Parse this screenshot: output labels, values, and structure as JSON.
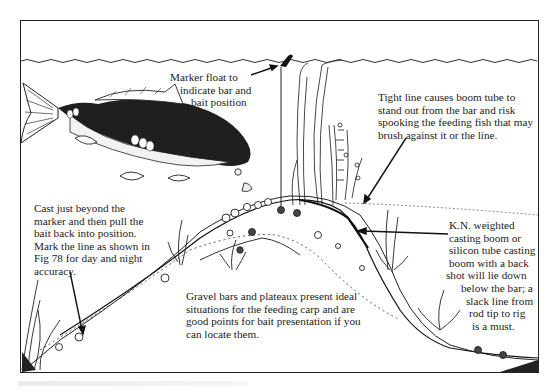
{
  "diagram": {
    "type": "illustrated-annotated-cross-section",
    "annotations": {
      "marker_float": [
        "Marker float to",
        "indicate bar and",
        "bait position"
      ],
      "tight_line": [
        "Tight line causes boom tube to",
        "stand out from the bar and risk",
        "spooking the feeding fish that may",
        "brush against it or the line."
      ],
      "cast": [
        "Cast just beyond the",
        "marker and then pull the",
        "bait back into position.",
        "Mark the line as shown in",
        "Fig 78 for day and night",
        "accuracy."
      ],
      "gravel_bars": [
        "Gravel bars and plateaux present ideal",
        "situations for the feeding carp and are",
        "good points for bait presentation if you",
        "can locate them."
      ],
      "boom": [
        "K.N. weighted",
        "casting boom or",
        "silicon tube casting",
        "boom with a back",
        "shot will lie down",
        "below the bar; a",
        "slack line from",
        "rod tip to rig",
        "is a must."
      ]
    },
    "elements": [
      "water-surface",
      "carp",
      "marker-float",
      "weed",
      "gravel-bar",
      "fishing-line",
      "boom-tube",
      "bait-pebbles",
      "lake-bed"
    ],
    "colors": {
      "ink": "#1a1a1a",
      "paper": "#ffffff"
    }
  }
}
